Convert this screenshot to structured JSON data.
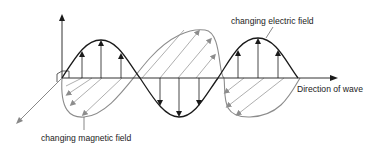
{
  "diagram": {
    "labels": {
      "electric_field": "changing electric field",
      "magnetic_field": "changing magnetic field",
      "direction": "Direction of wave"
    },
    "colors": {
      "electric": "#1a1a1a",
      "magnetic": "#8c8c8c",
      "axis": "#333333",
      "background": "#ffffff"
    },
    "components": [
      {
        "name": "electric-field-wave",
        "orientation": "vertical",
        "arrows": "up/down"
      },
      {
        "name": "magnetic-field-wave",
        "orientation": "oblique (perspective)",
        "arrows": "diagonal"
      },
      {
        "name": "propagation-axis",
        "direction": "right"
      }
    ]
  }
}
